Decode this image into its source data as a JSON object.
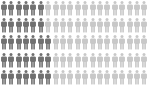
{
  "chart_data": {
    "type": "isotype",
    "title": "",
    "icon": "person-icon",
    "rows": 5,
    "columns": 20,
    "total_icons": 100,
    "highlighted_per_row": [
      6,
      6,
      7,
      7,
      7
    ],
    "highlighted_total": 33,
    "colors": {
      "highlighted": "#707070",
      "base": "#c8c8c8",
      "background": "#ffffff"
    },
    "legend": [],
    "xlabel": "",
    "ylabel": ""
  }
}
